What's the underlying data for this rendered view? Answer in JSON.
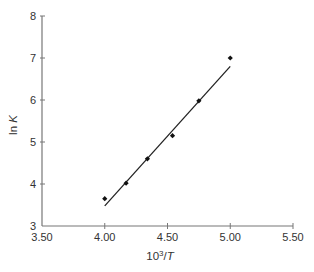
{
  "chart_data": {
    "type": "scatter",
    "title": "",
    "xlabel": "10³/T",
    "xlabel_base": "10",
    "xlabel_sup": "3",
    "xlabel_rest": "/",
    "xlabel_var": "T",
    "ylabel": "ln K",
    "ylabel_fn": "ln ",
    "ylabel_var": "K",
    "xlim": [
      3.5,
      5.5
    ],
    "ylim": [
      3,
      8
    ],
    "xticks": [
      3.5,
      4.0,
      4.5,
      5.0,
      5.5
    ],
    "xtick_labels": [
      "3.50",
      "4.00",
      "4.50",
      "5.00",
      "5.50"
    ],
    "yticks": [
      3,
      4,
      5,
      6,
      7,
      8
    ],
    "ytick_labels": [
      "3",
      "4",
      "5",
      "6",
      "7",
      "8"
    ],
    "grid": false,
    "legend": null,
    "series": [
      {
        "name": "data",
        "marker": "diamond",
        "points": [
          {
            "x": 4.0,
            "y": 3.65
          },
          {
            "x": 4.17,
            "y": 4.02
          },
          {
            "x": 4.34,
            "y": 4.6
          },
          {
            "x": 4.54,
            "y": 5.15
          },
          {
            "x": 4.75,
            "y": 5.98
          },
          {
            "x": 5.0,
            "y": 7.0
          }
        ]
      },
      {
        "name": "linear fit",
        "type": "line",
        "points": [
          {
            "x": 4.0,
            "y": 3.48
          },
          {
            "x": 5.0,
            "y": 6.8
          }
        ]
      }
    ],
    "colors": {
      "axis": "#777777",
      "points": "#111111",
      "fit_line": "#222222",
      "text": "#333333"
    }
  }
}
